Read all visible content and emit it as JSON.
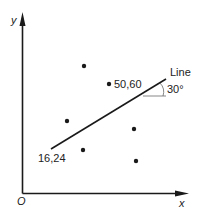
{
  "diagram": {
    "axes": {
      "x_label": "x",
      "y_label": "y",
      "origin_label": "O",
      "color": "#1a1a1a"
    },
    "line": {
      "label": "Line",
      "start_label": "16,24",
      "angle_label": "30°",
      "color": "#1a1a1a"
    },
    "points": [
      {
        "px": 84,
        "py": 66
      },
      {
        "px": 109,
        "py": 84,
        "label": "50,60"
      },
      {
        "px": 67,
        "py": 121
      },
      {
        "px": 134,
        "py": 129
      },
      {
        "px": 83,
        "py": 150
      },
      {
        "px": 136,
        "py": 161
      }
    ]
  }
}
